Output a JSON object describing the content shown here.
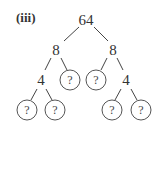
{
  "label": "(iii)",
  "tree": {
    "root": "64",
    "level1": [
      "8",
      "8"
    ],
    "level2": [
      "4",
      "?",
      "?",
      "4"
    ],
    "level3": [
      "?",
      "?",
      "?",
      "?"
    ]
  }
}
